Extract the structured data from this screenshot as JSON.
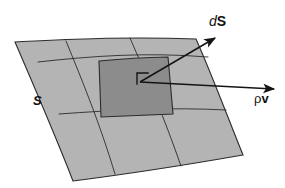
{
  "figure": {
    "type": "diagram",
    "caption_labels": {
      "surface_label": "S",
      "differential_area_label_d": "d",
      "differential_area_label_S": "S",
      "flux_label_rho": "ρ",
      "flux_label_v": "v"
    },
    "colors": {
      "background": "#ffffff",
      "surface_fill": "#b4b4b4",
      "patch_fill": "#8c8c8c",
      "outline": "#2b2b2b",
      "arrow": "#141414",
      "text": "#101010"
    },
    "elements": {
      "surface_name": "curved-surface-S",
      "patch_name": "differential-surface-patch",
      "normal_vector_name": "dS-normal-vector-arrow",
      "flux_vector_name": "rho-v-flux-vector-arrow",
      "right_angle_name": "right-angle-marker"
    },
    "geometry": {
      "surface_corners": [
        [
          15,
          42
        ],
        [
          196,
          39
        ],
        [
          243,
          155
        ],
        [
          73,
          181
        ]
      ],
      "patch_corners": [
        [
          99,
          61
        ],
        [
          168,
          57
        ],
        [
          173,
          114
        ],
        [
          101,
          117
        ]
      ],
      "ds_arrow": {
        "from": [
          140,
          82
        ],
        "to": [
          218,
          36
        ]
      },
      "flux_arrow": {
        "from": [
          140,
          82
        ],
        "to": [
          277,
          89
        ]
      }
    }
  }
}
